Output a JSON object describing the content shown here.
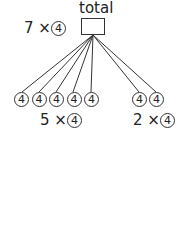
{
  "diagram": {
    "total_label": "total",
    "total_expr": {
      "multiplier": "7 ×",
      "unit": "4"
    },
    "groups": [
      {
        "count": 5,
        "expr": {
          "multiplier": "5 ×",
          "unit": "4"
        },
        "nodes": [
          "4",
          "4",
          "4",
          "4",
          "4"
        ]
      },
      {
        "count": 2,
        "expr": {
          "multiplier": "2 ×",
          "unit": "4"
        },
        "nodes": [
          "4",
          "4"
        ]
      }
    ],
    "line_color": "#333333"
  }
}
